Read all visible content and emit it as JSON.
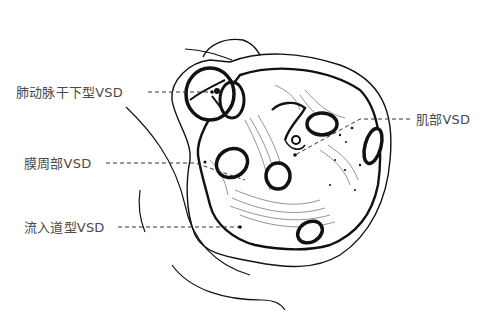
{
  "diagram": {
    "labels": [
      {
        "id": "subarterial",
        "text": "肺动脉干下型VSD",
        "x": 16,
        "y": 85
      },
      {
        "id": "muscular",
        "text": "肌部VSD",
        "x": 416,
        "y": 112
      },
      {
        "id": "perimembranous",
        "text": "膜周部VSD",
        "x": 24,
        "y": 156
      },
      {
        "id": "inlet",
        "text": "流入道型VSD",
        "x": 24,
        "y": 220
      }
    ],
    "colors": {
      "ink": "#111111",
      "label_text": "#4a4a4a",
      "leader_line": "#333333",
      "background": "#ffffff"
    }
  }
}
